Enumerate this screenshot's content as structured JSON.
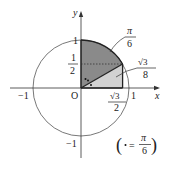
{
  "diagram": {
    "type": "unit-circle",
    "axes": {
      "x_label": "x",
      "y_label": "y",
      "origin_label": "O"
    },
    "ticks": {
      "x_neg": "−1",
      "x_pos": "1",
      "y_pos": "1",
      "y_neg": "−1",
      "y_half_num": "1",
      "y_half_den": "2",
      "x_root3_num": "√3",
      "x_root3_den": "2"
    },
    "regions": {
      "sector_label_num": "π",
      "sector_label_den": "6",
      "triangle_label_num": "√3",
      "triangle_label_den": "8"
    },
    "legend": {
      "open": "(",
      "equals": "=",
      "num": "π",
      "den": "6",
      "close": ")"
    },
    "colors": {
      "sector_fill": "#8a8a8a",
      "triangle_fill": "#d2d2d2",
      "stroke": "#333333"
    }
  }
}
